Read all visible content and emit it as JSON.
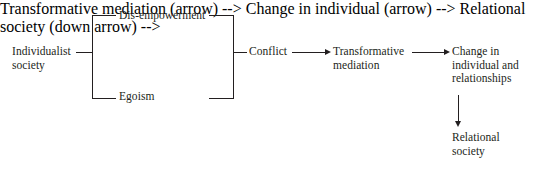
{
  "diagram": {
    "line_color": "#231f20",
    "text_color": "#231f20",
    "background": "#ffffff",
    "nodes": {
      "individualist_society": "Individualist\nsociety",
      "dis_empowerment": "Dis-empowerment",
      "egoism": "Egoism",
      "conflict": "Conflict",
      "transformative_mediation": "Transformative\nmediation",
      "change_in_individual": "Change in\nindividual and\nrelationships",
      "relational_society": "Relational\nsociety"
    },
    "connectors": [
      {
        "name": "individualist-to-bracket",
        "type": "line"
      },
      {
        "name": "left-bracket",
        "type": "bracket"
      },
      {
        "name": "bracket-to-dis-empowerment",
        "type": "line"
      },
      {
        "name": "bracket-to-egoism",
        "type": "line"
      },
      {
        "name": "dis-empowerment-to-right-bracket",
        "type": "line"
      },
      {
        "name": "egoism-to-right-bracket",
        "type": "line"
      },
      {
        "name": "right-bracket",
        "type": "bracket"
      },
      {
        "name": "right-bracket-to-conflict",
        "type": "line"
      },
      {
        "name": "conflict-to-transformative-mediation",
        "type": "arrow"
      },
      {
        "name": "transformative-mediation-to-change",
        "type": "arrow"
      },
      {
        "name": "change-to-relational-society",
        "type": "arrow-down"
      }
    ]
  }
}
